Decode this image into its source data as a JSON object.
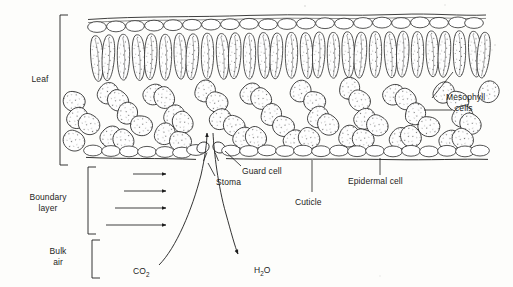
{
  "figure": {
    "type": "biological-diagram",
    "background_color": "#fdfdfb",
    "ink_color": "#1d1d1d"
  },
  "brackets": [
    {
      "id": "leaf",
      "label": "Leaf",
      "label_line1": "Leaf",
      "label_line2": ""
    },
    {
      "id": "boundary-layer",
      "label": "Boundary layer",
      "label_line1": "Boundary",
      "label_line2": "layer"
    },
    {
      "id": "bulk-air",
      "label": "Bulk air",
      "label_line1": "Bulk",
      "label_line2": "air"
    }
  ],
  "labels": {
    "mesophyll_line1": "Mesophyll",
    "mesophyll_line2": "cells",
    "guard_cell": "Guard cell",
    "stoma": "Stoma",
    "cuticle": "Cuticle",
    "epidermal_cell": "Epidermal cell"
  },
  "gas_labels": {
    "co2_main": "CO",
    "co2_sub": "2",
    "h2o_main_a": "H",
    "h2o_sub": "2",
    "h2o_main_b": "O"
  },
  "tissue_layers": [
    {
      "name": "cuticle",
      "position": "top",
      "description": "thin wavy line over upper epidermis"
    },
    {
      "name": "upper-epidermis",
      "position": "top",
      "description": "row of flattened oval cells"
    },
    {
      "name": "palisade-mesophyll",
      "position": "upper",
      "description": "tall columnar stippled cells"
    },
    {
      "name": "spongy-mesophyll",
      "position": "middle",
      "description": "irregular stippled cells with air spaces"
    },
    {
      "name": "lower-epidermis",
      "position": "bottom",
      "description": "row of oval cells interrupted by stoma"
    },
    {
      "name": "stoma",
      "position": "bottom",
      "description": "pore between two guard cells"
    }
  ],
  "flow": {
    "boundary_layer_arrows": 4,
    "boundary_arrow_direction": "right",
    "co2_direction": "into-leaf-through-stoma",
    "h2o_direction": "out-of-leaf-through-stoma"
  }
}
